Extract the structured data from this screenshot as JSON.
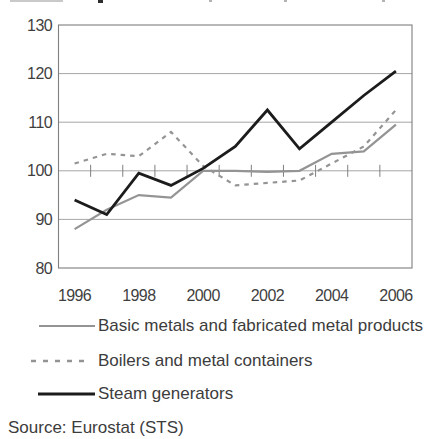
{
  "chart_data": {
    "type": "line",
    "title": "",
    "x": [
      1996,
      1997,
      1998,
      1999,
      2000,
      2001,
      2002,
      2003,
      2004,
      2005,
      2006
    ],
    "xtick_labels": [
      "1996",
      "1998",
      "2000",
      "2002",
      "2004",
      "2006"
    ],
    "ylim": [
      80,
      130
    ],
    "yticks": [
      130,
      120,
      110,
      100,
      90,
      80
    ],
    "grid": "horizontal",
    "baseline_axis_value": 100,
    "legend_position": "below",
    "series": [
      {
        "name": "Basic metals and fabricated metal products",
        "style": "solid",
        "color": "#949494",
        "values": [
          88,
          92,
          95,
          94.5,
          100,
          100,
          99.8,
          100,
          103.5,
          104,
          109.5
        ]
      },
      {
        "name": "Boilers and metal containers",
        "style": "dashed",
        "color": "#949494",
        "values": [
          101.5,
          103.5,
          103,
          108,
          101,
          97,
          97.5,
          98,
          101.5,
          105,
          112.5
        ]
      },
      {
        "name": "Steam generators",
        "style": "solid",
        "color": "#1c1c1c",
        "values": [
          94,
          91,
          99.5,
          97,
          100.5,
          105,
          112.5,
          104.5,
          110,
          115.5,
          120.5
        ]
      }
    ],
    "source": "Source: Eurostat (STS)"
  },
  "colors": {
    "plot_border": "#7f7f7f",
    "gridline": "#a6a6a6",
    "tick": "#7f7f7f",
    "text": "#3d3d3d",
    "background": "#ffffff"
  }
}
